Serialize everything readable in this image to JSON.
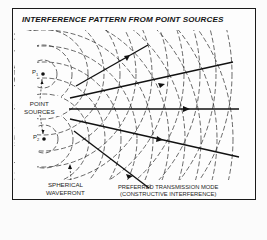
{
  "figure": {
    "title": "INTERFERENCE PATTERN FROM POINT SOURCES",
    "sources": [
      {
        "label": "P1",
        "sub": "1"
      },
      {
        "label": "P2",
        "sub": "2"
      }
    ],
    "labels": {
      "point_sources_line1": "POINT",
      "point_sources_line2": "SOURCES",
      "spherical_line1": "SPHERICAL",
      "spherical_line2": "WAVEFRONT",
      "preferred_line1": "PREFERRED TRANSMISSION MODE",
      "preferred_line2": "(CONSTRUCTIVE INTERFERENCE)"
    },
    "colors": {
      "ink": "#151515",
      "background": "#fdfdfd"
    }
  }
}
